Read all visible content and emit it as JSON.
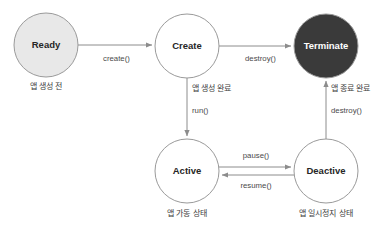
{
  "diagram": {
    "type": "state-machine",
    "colors": {
      "ready_fill": "#e8e8e8",
      "ready_stroke": "#9a9a9a",
      "plain_fill": "#ffffff",
      "plain_stroke": "#9a9a9a",
      "terminate_fill": "#3a3a3a",
      "terminate_stroke": "#3a3a3a",
      "edge_stroke": "#8c8c8c",
      "label_text": "#4a4a4a",
      "caption_text": "#3d3d3d",
      "background": "#ffffff"
    },
    "nodes": [
      {
        "id": "ready",
        "label": "Ready",
        "caption": "앱 생성 전",
        "cx": 46,
        "cy": 45,
        "r": 32,
        "fill": "#e8e8e8",
        "stroke": "#9a9a9a",
        "text_style": "light-node",
        "caption_x": 46,
        "caption_y": 87
      },
      {
        "id": "create",
        "label": "Create",
        "caption": "",
        "cx": 187,
        "cy": 46,
        "r": 32,
        "fill": "#ffffff",
        "stroke": "#9a9a9a",
        "text_style": "light-node",
        "caption_x": 187,
        "caption_y": 88
      },
      {
        "id": "terminate",
        "label": "Terminate",
        "caption": "",
        "cx": 326,
        "cy": 46,
        "r": 32,
        "fill": "#3a3a3a",
        "stroke": "#3a3a3a",
        "text_style": "dark-node",
        "caption_x": 326,
        "caption_y": 88
      },
      {
        "id": "active",
        "label": "Active",
        "caption": "앱 가동 상태",
        "cx": 187,
        "cy": 171,
        "r": 32,
        "fill": "#ffffff",
        "stroke": "#9a9a9a",
        "text_style": "light-node",
        "caption_x": 187,
        "caption_y": 214
      },
      {
        "id": "deactive",
        "label": "Deactive",
        "caption": "앱 일시정지 상태",
        "cx": 326,
        "cy": 171,
        "r": 32,
        "fill": "#ffffff",
        "stroke": "#9a9a9a",
        "text_style": "light-node",
        "caption_x": 326,
        "caption_y": 214
      }
    ],
    "edges": [
      {
        "id": "ready-to-create",
        "from": "ready",
        "to": "create",
        "label": "create()",
        "label_x": 103,
        "label_y": 59,
        "anchor": "start",
        "path": "M 78 45 L 152 45"
      },
      {
        "id": "create-to-terminate",
        "from": "create",
        "to": "terminate",
        "label": "destroy()",
        "label_x": 245,
        "label_y": 59,
        "anchor": "start",
        "path": "M 219 46 L 291 46"
      },
      {
        "id": "create-to-active",
        "from": "create",
        "to": "active",
        "label": "run()",
        "label_x": 192,
        "label_y": 111,
        "anchor": "start",
        "caption": "앱 생성 완료",
        "caption_x": 192,
        "caption_y": 89,
        "path": "M 187 78 L 187 136"
      },
      {
        "id": "deactive-to-terminate",
        "from": "deactive",
        "to": "terminate",
        "label": "destroy()",
        "label_x": 331,
        "label_y": 111,
        "anchor": "start",
        "caption": "앱 종료 완료",
        "caption_x": 331,
        "caption_y": 89,
        "path": "M 326 139 L 326 81"
      },
      {
        "id": "active-to-deactive",
        "from": "active",
        "to": "deactive",
        "label": "pause()",
        "label_x": 256,
        "label_y": 156,
        "anchor": "middle",
        "path": "M 219 167 L 291 167"
      },
      {
        "id": "deactive-to-active",
        "from": "deactive",
        "to": "active",
        "label": "resume()",
        "label_x": 256,
        "label_y": 186,
        "anchor": "middle",
        "path": "M 294 175 L 222 175"
      }
    ]
  }
}
